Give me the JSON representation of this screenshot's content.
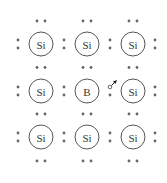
{
  "diagram": {
    "title": "",
    "lattice": [
      [
        "Si",
        "Si",
        "Si"
      ],
      [
        "Si",
        "B",
        "Si"
      ],
      [
        "Si",
        "Si",
        "Si"
      ]
    ],
    "hole": {
      "row": 1,
      "between_cols": [
        1,
        2
      ],
      "position": "upper",
      "description": "hole with arrow indicating electron movement"
    },
    "colors": {
      "stroke": "#555555",
      "dot": "#666666",
      "text": "#333333"
    }
  }
}
